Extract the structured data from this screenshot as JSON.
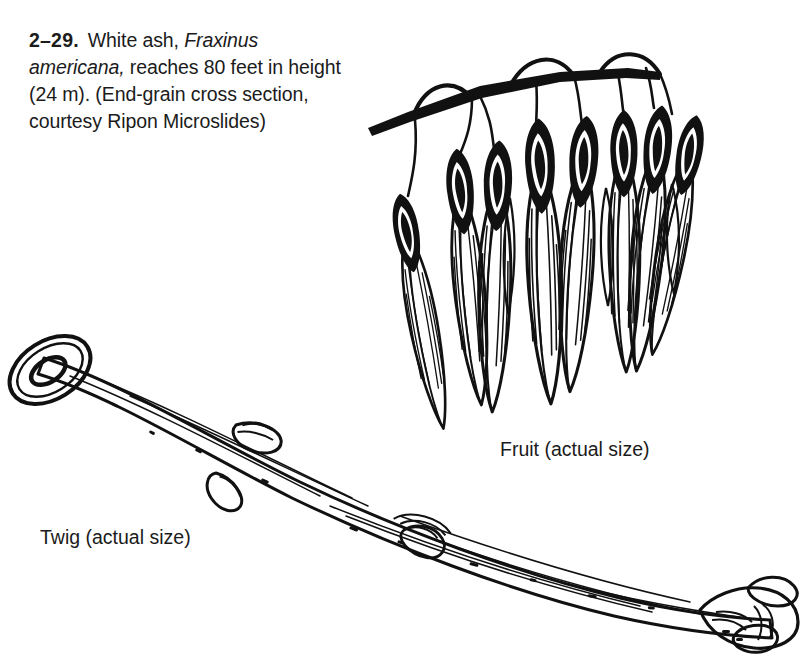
{
  "figure": {
    "number": "2–29.",
    "caption_text": "White ash, Fraxinus americana, reaches 80 feet in height (24 m). (End-grain cross section, courtesy Ripon Microslides)",
    "caption_part_1": "White ash,",
    "caption_species": "Fraxinus americana,",
    "caption_part_2": "reaches 80 feet in height (24 m). (End-grain cross section, courtesy Ripon Microslides)",
    "common_name": "White ash",
    "scientific_name": "Fraxinus americana",
    "height_feet": "80 feet",
    "height_metric": "24 m",
    "credit": "courtesy Ripon Microslides",
    "specimen_note": "End-grain cross section"
  },
  "labels": {
    "fruit": "Fruit (actual size)",
    "twig": "Twig (actual size)"
  },
  "illustrations": {
    "fruit": {
      "name": "samara-cluster",
      "description": "Hanging cluster of winged ash fruits (samaras) on a branched stalk",
      "samara_count": 8
    },
    "twig": {
      "name": "ash-twig",
      "description": "Ash twig with cut end showing pith ring, lateral buds, leaf scars and terminal bud",
      "bud_count": 4
    }
  },
  "colors": {
    "background": "#ffffff",
    "ink": "#111111",
    "text": "#1b1b1b"
  }
}
